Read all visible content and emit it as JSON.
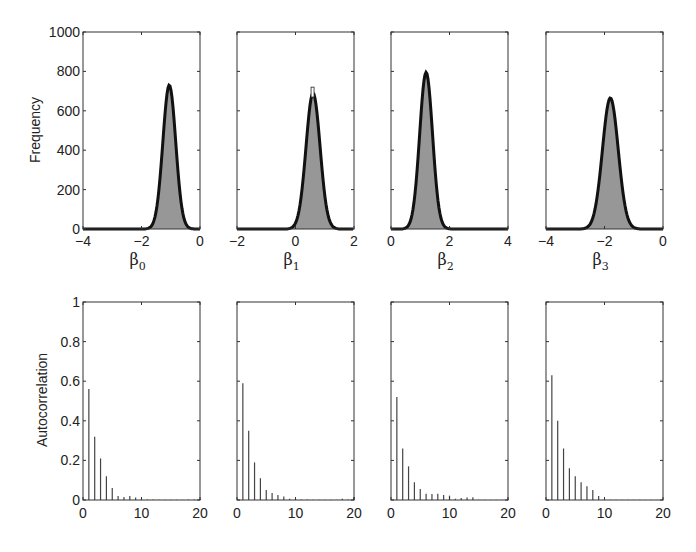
{
  "chart_data": [
    {
      "type": "bar",
      "subtype": "histogram-with-density",
      "panel": "top-1",
      "xlabel": "β0",
      "ylabel": "Frequency",
      "xlim": [
        -4,
        0
      ],
      "ylim": [
        0,
        1000
      ],
      "xticks": [
        "-4",
        "-2",
        "0"
      ],
      "yticks": [
        "0",
        "200",
        "400",
        "600",
        "800",
        "1000"
      ],
      "peak_x": -1.05,
      "peak_y": 730,
      "sd": 0.22
    },
    {
      "type": "bar",
      "subtype": "histogram-with-density",
      "panel": "top-2",
      "xlabel": "β1",
      "xlim": [
        -2,
        2
      ],
      "ylim": [
        0,
        1000
      ],
      "xticks": [
        "-2",
        "0",
        "2"
      ],
      "peak_x": 0.6,
      "peak_y": 690,
      "max_bar": 720,
      "sd": 0.24
    },
    {
      "type": "bar",
      "subtype": "histogram-with-density",
      "panel": "top-3",
      "xlabel": "β2",
      "xlim": [
        0,
        4
      ],
      "ylim": [
        0,
        1000
      ],
      "xticks": [
        "0",
        "2",
        "4"
      ],
      "peak_x": 1.2,
      "peak_y": 795,
      "sd": 0.22
    },
    {
      "type": "bar",
      "subtype": "histogram-with-density",
      "panel": "top-4",
      "xlabel": "β3",
      "xlim": [
        -4,
        0
      ],
      "ylim": [
        0,
        1000
      ],
      "xticks": [
        "-4",
        "-2",
        "0"
      ],
      "peak_x": -1.8,
      "peak_y": 665,
      "sd": 0.27
    },
    {
      "type": "bar",
      "subtype": "stem",
      "panel": "bottom-1",
      "ylabel": "Autocorrelation",
      "xlim": [
        0,
        20
      ],
      "ylim": [
        0,
        1
      ],
      "xticks": [
        "0",
        "10",
        "20"
      ],
      "yticks": [
        "0",
        "0.2",
        "0.4",
        "0.6",
        "0.8",
        "1"
      ],
      "lags": [
        1,
        2,
        3,
        4,
        5,
        6,
        7,
        8,
        9,
        10,
        11,
        12,
        13,
        14,
        15,
        16,
        17,
        18,
        19,
        20
      ],
      "values": [
        0.56,
        0.32,
        0.21,
        0.12,
        0.06,
        0.02,
        0.015,
        0.02,
        0.012,
        0.006,
        0.002,
        0.002,
        0.001,
        0.001,
        0.001,
        0.001,
        0.001,
        0.003,
        0.003,
        0.005
      ]
    },
    {
      "type": "bar",
      "subtype": "stem",
      "panel": "bottom-2",
      "xlim": [
        0,
        20
      ],
      "ylim": [
        0,
        1
      ],
      "xticks": [
        "0",
        "10",
        "20"
      ],
      "lags": [
        1,
        2,
        3,
        4,
        5,
        6,
        7,
        8,
        9,
        10,
        11,
        12,
        13,
        14,
        15,
        16,
        17,
        18,
        19,
        20
      ],
      "values": [
        0.59,
        0.35,
        0.19,
        0.11,
        0.05,
        0.035,
        0.025,
        0.018,
        0.006,
        0.006,
        0.002,
        0.002,
        0.001,
        0.001,
        0.001,
        0.001,
        0.001,
        0.006,
        0.003,
        0.015
      ]
    },
    {
      "type": "bar",
      "subtype": "stem",
      "panel": "bottom-3",
      "xlim": [
        0,
        20
      ],
      "ylim": [
        0,
        1
      ],
      "xticks": [
        "0",
        "10",
        "20"
      ],
      "lags": [
        1,
        2,
        3,
        4,
        5,
        6,
        7,
        8,
        9,
        10,
        11,
        12,
        13,
        14,
        15,
        16,
        17,
        18,
        19,
        20
      ],
      "values": [
        0.52,
        0.26,
        0.17,
        0.09,
        0.055,
        0.032,
        0.03,
        0.032,
        0.025,
        0.022,
        0.006,
        0.01,
        0.012,
        0.014,
        0.001,
        0.001,
        0.001,
        0.001,
        0.001,
        0.006
      ]
    },
    {
      "type": "bar",
      "subtype": "stem",
      "panel": "bottom-4",
      "xlim": [
        0,
        20
      ],
      "ylim": [
        0,
        1
      ],
      "xticks": [
        "0",
        "10",
        "20"
      ],
      "lags": [
        1,
        2,
        3,
        4,
        5,
        6,
        7,
        8,
        9,
        10,
        11,
        12,
        13,
        14,
        15,
        16,
        17,
        18,
        19,
        20
      ],
      "values": [
        0.63,
        0.4,
        0.26,
        0.16,
        0.12,
        0.09,
        0.07,
        0.05,
        0.02,
        0.003,
        0.001,
        0.001,
        0.001,
        0.001,
        0.001,
        0.001,
        0.001,
        0.001,
        0.001,
        0.001
      ]
    }
  ],
  "labels": {
    "top_ylabel": "Frequency",
    "bottom_ylabel": "Autocorrelation",
    "beta_symbol": "β",
    "subscripts": [
      "0",
      "1",
      "2",
      "3"
    ]
  }
}
